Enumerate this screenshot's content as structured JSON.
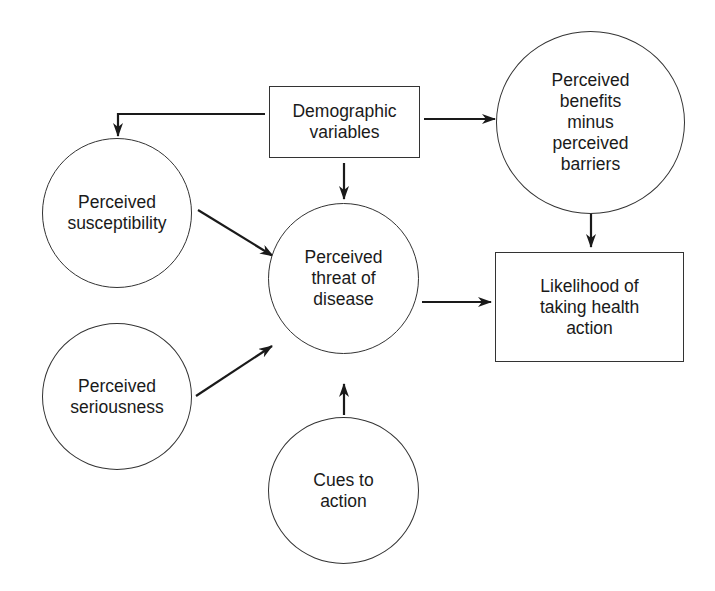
{
  "diagram": {
    "nodes": {
      "demographic": {
        "shape": "rect",
        "label": "Demographic\nvariables"
      },
      "susceptibility": {
        "shape": "circle",
        "label": "Perceived\nsusceptibility"
      },
      "seriousness": {
        "shape": "circle",
        "label": "Perceived\nseriousness"
      },
      "threat": {
        "shape": "circle",
        "label": "Perceived\nthreat of\ndisease"
      },
      "cues": {
        "shape": "circle",
        "label": "Cues to\naction"
      },
      "benefits": {
        "shape": "circle",
        "label": "Perceived\nbenefits\nminus\nperceived\nbarriers"
      },
      "likelihood": {
        "shape": "rect",
        "label": "Likelihood of\ntaking health\naction"
      }
    },
    "edges": [
      {
        "from": "demographic",
        "to": "susceptibility"
      },
      {
        "from": "demographic",
        "to": "threat"
      },
      {
        "from": "demographic",
        "to": "benefits"
      },
      {
        "from": "susceptibility",
        "to": "threat"
      },
      {
        "from": "seriousness",
        "to": "threat"
      },
      {
        "from": "cues",
        "to": "threat"
      },
      {
        "from": "threat",
        "to": "likelihood"
      },
      {
        "from": "benefits",
        "to": "likelihood"
      }
    ],
    "colors": {
      "stroke": "#333333",
      "arrow": "#1a1a1a",
      "background": "#ffffff"
    }
  }
}
